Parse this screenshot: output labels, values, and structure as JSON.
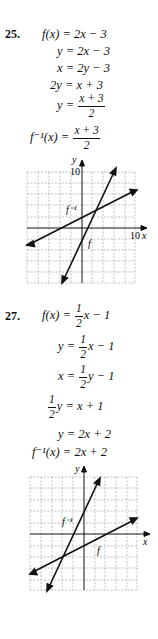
{
  "problems": [
    {
      "number": "25.",
      "steps": [
        {
          "lhs": "f(x)",
          "rhs": "2x − 3"
        },
        {
          "lhs": "y",
          "rhs": "2x − 3"
        },
        {
          "lhs": "x",
          "rhs": "2y − 3"
        },
        {
          "lhs": "2y",
          "rhs": "x + 3"
        },
        {
          "lhs": "y",
          "rhs_num": "x + 3",
          "rhs_den": "2"
        },
        {
          "lhs": "f⁻¹(x)",
          "rhs_num": "x + 3",
          "rhs_den": "2"
        }
      ],
      "graph": {
        "y_axis_label": "y",
        "x_axis_label": "x",
        "y_tick_label": "10",
        "x_tick_label": "10",
        "curve_f_label": "f",
        "curve_finv_label": "f⁻¹",
        "range": [
          -10,
          10
        ]
      }
    },
    {
      "number": "27.",
      "steps": [
        {
          "lhs": "f(x)",
          "coef_num": "1",
          "coef_den": "2",
          "rhs_rest": "x − 1"
        },
        {
          "lhs": "y",
          "coef_num": "1",
          "coef_den": "2",
          "rhs_rest": "x − 1"
        },
        {
          "lhs": "x",
          "coef_num": "1",
          "coef_den": "2",
          "rhs_rest": "y − 1"
        },
        {
          "lhs_num": "1",
          "lhs_den": "2",
          "lhs_rest": "y",
          "rhs": "x + 1"
        },
        {
          "lhs": "y",
          "rhs": "2x + 2"
        },
        {
          "lhs": "f⁻¹(x)",
          "rhs": "2x + 2"
        }
      ],
      "graph": {
        "y_axis_label": "y",
        "x_axis_label": "x",
        "curve_f_label": "f",
        "curve_finv_label": "f⁻¹",
        "range": [
          -5,
          5
        ]
      }
    }
  ]
}
